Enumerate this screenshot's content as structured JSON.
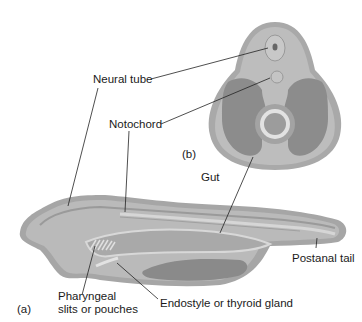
{
  "figure": {
    "panel_b_label": "(b)",
    "panel_a_label": "(a)",
    "labels": {
      "neural_tube": "Neural tube",
      "notochord": "Notochord",
      "gut": "Gut",
      "postanal_tail": "Postanal tail",
      "pharyngeal_line1": "Pharyngeal",
      "pharyngeal_line2": "slits or pouches",
      "endostyle": "Endostyle or thyroid gland"
    },
    "colors": {
      "outer": "#a8a8a8",
      "body": "#b9b9b9",
      "dark": "#8a8a8a",
      "light": "#d9d9d9"
    }
  }
}
